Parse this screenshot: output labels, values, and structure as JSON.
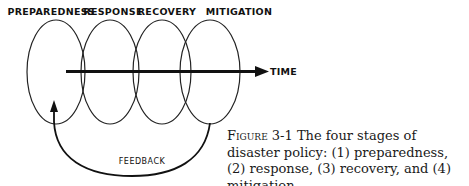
{
  "diagram": {
    "stages": [
      {
        "label": "PREPAREDNESS",
        "cx": 56,
        "label_x": 51
      },
      {
        "label": "RESPONSE",
        "cx": 110,
        "label_x": 114
      },
      {
        "label": "RECOVERY",
        "cx": 162,
        "label_x": 167
      },
      {
        "label": "MITIGATION",
        "cx": 210,
        "label_x": 239
      }
    ],
    "time_axis_label": "TIME",
    "feedback_label": "FEEDBACK"
  },
  "caption": {
    "figure_label": "Figure 3-1",
    "text": " The four stages of disaster policy: (1) preparedness, (2) response, (3) recovery, and (4) mitigation."
  }
}
